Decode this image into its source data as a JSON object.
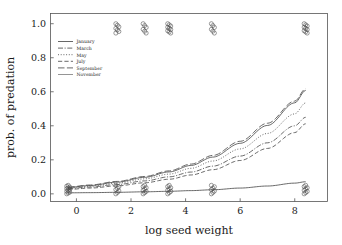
{
  "chart_data": {
    "type": "line",
    "title": "",
    "xlabel": "log seed weight",
    "ylabel": "prob. of predation",
    "xlim": [
      -0.95,
      9.2
    ],
    "ylim": [
      -0.045,
      1.06
    ],
    "grid": false,
    "legend_position": "upper left",
    "xticks": [
      "0",
      "2",
      "4",
      "6",
      "8"
    ],
    "xtick_values": [
      0,
      2,
      4,
      6,
      8
    ],
    "yticks": [
      "0.0",
      "0.2",
      "0.4",
      "0.6",
      "0.8",
      "1.0"
    ],
    "ytick_values": [
      0.0,
      0.2,
      0.4,
      0.6,
      0.8,
      1.0
    ],
    "x": [
      -0.3,
      0.5,
      1.5,
      2.5,
      3.4,
      4.2,
      5.0,
      6.0,
      7.0,
      8.0,
      8.4
    ],
    "series": [
      {
        "name": "January",
        "style": "solid",
        "values": [
          0.006,
          0.007,
          0.009,
          0.012,
          0.015,
          0.019,
          0.024,
          0.034,
          0.046,
          0.063,
          0.071
        ]
      },
      {
        "name": "March",
        "style": "dashdot",
        "values": [
          0.031,
          0.04,
          0.055,
          0.076,
          0.1,
          0.128,
          0.163,
          0.222,
          0.3,
          0.4,
          0.45
        ]
      },
      {
        "name": "May",
        "style": "dotted",
        "values": [
          0.035,
          0.045,
          0.063,
          0.088,
          0.116,
          0.15,
          0.193,
          0.264,
          0.355,
          0.47,
          0.535
        ]
      },
      {
        "name": "July",
        "style": "dashed",
        "values": [
          0.026,
          0.034,
          0.047,
          0.065,
          0.086,
          0.111,
          0.142,
          0.196,
          0.267,
          0.36,
          0.412
        ]
      },
      {
        "name": "September",
        "style": "longdash",
        "values": [
          0.04,
          0.052,
          0.073,
          0.102,
          0.135,
          0.175,
          0.226,
          0.309,
          0.415,
          0.545,
          0.618
        ]
      },
      {
        "name": "November",
        "style": "thin-solid",
        "values": [
          0.038,
          0.049,
          0.069,
          0.097,
          0.129,
          0.167,
          0.216,
          0.297,
          0.402,
          0.535,
          0.608
        ]
      }
    ],
    "scatter": {
      "marker": "open-circle",
      "cluster_x": [
        -0.3,
        1.5,
        2.5,
        3.4,
        5.0,
        8.4
      ],
      "levels": [
        0.0,
        1.0
      ],
      "top_counts": [
        0,
        7,
        6,
        9,
        6,
        9
      ],
      "bottom_counts": [
        11,
        7,
        8,
        8,
        7,
        8
      ]
    }
  }
}
